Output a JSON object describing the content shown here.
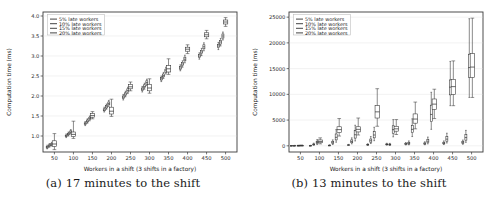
{
  "figure": {
    "panels": [
      {
        "id": "panel-a",
        "caption": "(a) 17 minutes to the shift",
        "chart_data": {
          "type": "box",
          "title": "",
          "xlabel": "Workers in a shift (3 shifts in a factory)",
          "ylabel": "Computation time (ms)",
          "xlim": [
            20,
            530
          ],
          "ylim": [
            0.6,
            4.1
          ],
          "xticks": [
            50,
            100,
            150,
            200,
            250,
            300,
            350,
            400,
            450,
            500
          ],
          "yticks": [
            1.0,
            1.5,
            2.0,
            2.5,
            3.0,
            3.5,
            4.0
          ],
          "grid": true,
          "legend_position": "upper left",
          "legend": [
            "5% late workers",
            "10% late workers",
            "15% late workers",
            "20% late workers"
          ],
          "x": [
            35,
            85,
            135,
            185,
            235,
            285,
            335,
            385,
            435,
            485
          ],
          "series": [
            {
              "name": "5% late workers",
              "offset": -4,
              "boxes": [
                {
                  "q1": 0.7,
                  "med": 0.72,
                  "q3": 0.74,
                  "lo": 0.68,
                  "hi": 0.77
                },
                {
                  "q1": 0.99,
                  "med": 1.0,
                  "q3": 1.02,
                  "lo": 0.96,
                  "hi": 1.05
                },
                {
                  "q1": 1.29,
                  "med": 1.31,
                  "q3": 1.33,
                  "lo": 1.26,
                  "hi": 1.36
                },
                {
                  "q1": 1.63,
                  "med": 1.65,
                  "q3": 1.68,
                  "lo": 1.6,
                  "hi": 1.72
                },
                {
                  "q1": 1.94,
                  "med": 1.97,
                  "q3": 2.0,
                  "lo": 1.9,
                  "hi": 2.04
                },
                {
                  "q1": 2.14,
                  "med": 2.17,
                  "q3": 2.2,
                  "lo": 2.1,
                  "hi": 2.24
                },
                {
                  "q1": 2.4,
                  "med": 2.43,
                  "q3": 2.46,
                  "lo": 2.36,
                  "hi": 2.5
                },
                {
                  "q1": 2.67,
                  "med": 2.7,
                  "q3": 2.74,
                  "lo": 2.63,
                  "hi": 2.78
                },
                {
                  "q1": 2.97,
                  "med": 3.0,
                  "q3": 3.04,
                  "lo": 2.92,
                  "hi": 3.08
                },
                {
                  "q1": 3.21,
                  "med": 3.25,
                  "q3": 3.29,
                  "lo": 3.16,
                  "hi": 3.34
                }
              ]
            },
            {
              "name": "10% late workers",
              "offset": 2,
              "boxes": [
                {
                  "q1": 0.74,
                  "med": 0.76,
                  "q3": 0.78,
                  "lo": 0.72,
                  "hi": 0.81
                },
                {
                  "q1": 1.03,
                  "med": 1.05,
                  "q3": 1.07,
                  "lo": 1.0,
                  "hi": 1.1
                },
                {
                  "q1": 1.35,
                  "med": 1.37,
                  "q3": 1.4,
                  "lo": 1.32,
                  "hi": 1.43
                },
                {
                  "q1": 1.7,
                  "med": 1.73,
                  "q3": 1.76,
                  "lo": 1.67,
                  "hi": 1.8
                },
                {
                  "q1": 2.02,
                  "med": 2.05,
                  "q3": 2.08,
                  "lo": 1.98,
                  "hi": 2.12
                },
                {
                  "q1": 2.21,
                  "med": 2.24,
                  "q3": 2.28,
                  "lo": 2.17,
                  "hi": 2.32
                },
                {
                  "q1": 2.48,
                  "med": 2.51,
                  "q3": 2.55,
                  "lo": 2.44,
                  "hi": 2.59
                },
                {
                  "q1": 2.76,
                  "med": 2.8,
                  "q3": 2.84,
                  "lo": 2.72,
                  "hi": 2.88
                },
                {
                  "q1": 3.06,
                  "med": 3.1,
                  "q3": 3.14,
                  "lo": 3.01,
                  "hi": 3.19
                },
                {
                  "q1": 3.3,
                  "med": 3.35,
                  "q3": 3.39,
                  "lo": 3.25,
                  "hi": 3.44
                }
              ]
            },
            {
              "name": "15% late workers",
              "offset": 8,
              "boxes": [
                {
                  "q1": 0.77,
                  "med": 0.79,
                  "q3": 0.81,
                  "lo": 0.75,
                  "hi": 0.84
                },
                {
                  "q1": 1.08,
                  "med": 1.1,
                  "q3": 1.13,
                  "lo": 1.05,
                  "hi": 1.16
                },
                {
                  "q1": 1.41,
                  "med": 1.44,
                  "q3": 1.47,
                  "lo": 1.38,
                  "hi": 1.5
                },
                {
                  "q1": 1.78,
                  "med": 1.81,
                  "q3": 1.85,
                  "lo": 1.74,
                  "hi": 1.89
                },
                {
                  "q1": 2.1,
                  "med": 2.14,
                  "q3": 2.18,
                  "lo": 2.06,
                  "hi": 2.22
                },
                {
                  "q1": 2.3,
                  "med": 2.34,
                  "q3": 2.38,
                  "lo": 2.26,
                  "hi": 2.42
                },
                {
                  "q1": 2.59,
                  "med": 2.63,
                  "q3": 2.67,
                  "lo": 2.55,
                  "hi": 2.72
                },
                {
                  "q1": 2.88,
                  "med": 2.92,
                  "q3": 2.97,
                  "lo": 2.83,
                  "hi": 3.02
                },
                {
                  "q1": 3.18,
                  "med": 3.23,
                  "q3": 3.28,
                  "lo": 3.13,
                  "hi": 3.33
                },
                {
                  "q1": 3.45,
                  "med": 3.5,
                  "q3": 3.55,
                  "lo": 3.4,
                  "hi": 3.6
                }
              ]
            },
            {
              "name": "20% late workers",
              "offset": 15,
              "wide": true,
              "boxes": [
                {
                  "q1": 0.74,
                  "med": 0.8,
                  "q3": 0.88,
                  "lo": 0.66,
                  "hi": 1.06
                },
                {
                  "q1": 0.99,
                  "med": 1.04,
                  "q3": 1.1,
                  "lo": 0.94,
                  "hi": 1.37
                },
                {
                  "q1": 1.47,
                  "med": 1.51,
                  "q3": 1.56,
                  "lo": 1.43,
                  "hi": 1.61
                },
                {
                  "q1": 1.55,
                  "med": 1.62,
                  "q3": 1.72,
                  "lo": 1.49,
                  "hi": 1.92
                },
                {
                  "q1": 2.18,
                  "med": 2.23,
                  "q3": 2.29,
                  "lo": 2.13,
                  "hi": 2.35
                },
                {
                  "q1": 2.13,
                  "med": 2.2,
                  "q3": 2.29,
                  "lo": 2.07,
                  "hi": 2.43
                },
                {
                  "q1": 2.6,
                  "med": 2.68,
                  "q3": 2.76,
                  "lo": 2.54,
                  "hi": 2.93
                },
                {
                  "q1": 3.12,
                  "med": 3.17,
                  "q3": 3.22,
                  "lo": 3.06,
                  "hi": 3.28
                },
                {
                  "q1": 3.48,
                  "med": 3.53,
                  "q3": 3.58,
                  "lo": 3.43,
                  "hi": 3.64
                },
                {
                  "q1": 3.8,
                  "med": 3.85,
                  "q3": 3.9,
                  "lo": 3.74,
                  "hi": 3.96
                }
              ]
            }
          ]
        }
      },
      {
        "id": "panel-b",
        "caption": "(b) 13 minutes to the shift",
        "chart_data": {
          "type": "box",
          "title": "",
          "xlabel": "Workers in a shift (3 shifts in a factory)",
          "ylabel": "Computation time (ms)",
          "xlim": [
            20,
            530
          ],
          "ylim": [
            -1200,
            26000
          ],
          "xticks": [
            50,
            100,
            150,
            200,
            250,
            300,
            350,
            400,
            450,
            500
          ],
          "yticks": [
            0,
            5000,
            10000,
            15000,
            20000,
            25000
          ],
          "grid": true,
          "legend_position": "upper left",
          "legend": [
            "5% late workers",
            "10% late workers",
            "15% late workers",
            "20% late workers"
          ],
          "x": [
            35,
            85,
            135,
            185,
            235,
            285,
            335,
            385,
            435,
            485
          ],
          "series": [
            {
              "name": "5% late workers",
              "offset": -8,
              "boxes": [
                {
                  "q1": 20,
                  "med": 30,
                  "q3": 45,
                  "lo": 10,
                  "hi": 60
                },
                {
                  "q1": 40,
                  "med": 55,
                  "q3": 75,
                  "lo": 25,
                  "hi": 100
                },
                {
                  "q1": 70,
                  "med": 95,
                  "q3": 130,
                  "lo": 45,
                  "hi": 180
                },
                {
                  "q1": 110,
                  "med": 150,
                  "q3": 200,
                  "lo": 70,
                  "hi": 280
                },
                {
                  "q1": 160,
                  "med": 220,
                  "q3": 300,
                  "lo": 100,
                  "hi": 400
                },
                {
                  "q1": 200,
                  "med": 270,
                  "q3": 370,
                  "lo": 130,
                  "hi": 500
                },
                {
                  "q1": 260,
                  "med": 350,
                  "q3": 470,
                  "lo": 170,
                  "hi": 640
                },
                {
                  "q1": 320,
                  "med": 430,
                  "q3": 580,
                  "lo": 210,
                  "hi": 780
                },
                {
                  "q1": 390,
                  "med": 520,
                  "q3": 700,
                  "lo": 250,
                  "hi": 950
                },
                {
                  "q1": 460,
                  "med": 610,
                  "q3": 830,
                  "lo": 300,
                  "hi": 1120
                }
              ]
            },
            {
              "name": "10% late workers",
              "offset": 0,
              "boxes": [
                {
                  "q1": 30,
                  "med": 45,
                  "q3": 65,
                  "lo": 15,
                  "hi": 90
                },
                {
                  "q1": 180,
                  "med": 260,
                  "q3": 360,
                  "lo": 110,
                  "hi": 520
                },
                {
                  "q1": 420,
                  "med": 600,
                  "q3": 830,
                  "lo": 260,
                  "hi": 1150
                },
                {
                  "q1": 600,
                  "med": 850,
                  "q3": 1150,
                  "lo": 380,
                  "hi": 1550
                },
                {
                  "q1": 700,
                  "med": 980,
                  "q3": 1320,
                  "lo": 440,
                  "hi": 1800
                },
                {
                  "q1": 160,
                  "med": 240,
                  "q3": 340,
                  "lo": 90,
                  "hi": 480
                },
                {
                  "q1": 330,
                  "med": 480,
                  "q3": 680,
                  "lo": 200,
                  "hi": 950
                },
                {
                  "q1": 620,
                  "med": 900,
                  "q3": 1250,
                  "lo": 380,
                  "hi": 1700
                },
                {
                  "q1": 900,
                  "med": 1300,
                  "q3": 1800,
                  "lo": 550,
                  "hi": 2450
                },
                {
                  "q1": 1100,
                  "med": 1600,
                  "q3": 2200,
                  "lo": 680,
                  "hi": 3000
                }
              ]
            },
            {
              "name": "15% late workers",
              "offset": 9,
              "boxes": [
                {
                  "q1": 40,
                  "med": 60,
                  "q3": 85,
                  "lo": 20,
                  "hi": 120
                },
                {
                  "q1": 420,
                  "med": 620,
                  "q3": 870,
                  "lo": 250,
                  "hi": 1200
                },
                {
                  "q1": 1150,
                  "med": 1650,
                  "q3": 2300,
                  "lo": 700,
                  "hi": 3150
                },
                {
                  "q1": 1500,
                  "med": 2150,
                  "q3": 2950,
                  "lo": 950,
                  "hi": 4000
                },
                {
                  "q1": 1550,
                  "med": 2100,
                  "q3": 2750,
                  "lo": 1000,
                  "hi": 3600
                },
                {
                  "q1": 2450,
                  "med": 3150,
                  "q3": 3900,
                  "lo": 1750,
                  "hi": 5100
                },
                {
                  "q1": 2550,
                  "med": 3200,
                  "q3": 3950,
                  "lo": 1800,
                  "hi": 5250
                },
                {
                  "q1": 4700,
                  "med": 6100,
                  "q3": 7900,
                  "lo": 3200,
                  "hi": 10400
                },
                {
                  "q1": 9900,
                  "med": 11400,
                  "q3": 12800,
                  "lo": 7800,
                  "hi": 16400
                },
                {
                  "q1": 13300,
                  "med": 15200,
                  "q3": 17800,
                  "lo": 9400,
                  "hi": 24700
                }
              ]
            },
            {
              "name": "20% late workers",
              "offset": 17,
              "wide": true,
              "boxes": [
                {
                  "q1": 50,
                  "med": 75,
                  "q3": 105,
                  "lo": 25,
                  "hi": 150
                },
                {
                  "q1": 600,
                  "med": 850,
                  "q3": 1150,
                  "lo": 380,
                  "hi": 1550
                },
                {
                  "q1": 2600,
                  "med": 3150,
                  "q3": 3700,
                  "lo": 1900,
                  "hi": 5300
                },
                {
                  "q1": 2700,
                  "med": 3200,
                  "q3": 3700,
                  "lo": 2100,
                  "hi": 5400
                },
                {
                  "q1": 5400,
                  "med": 6600,
                  "q3": 7800,
                  "lo": 3800,
                  "hi": 11100
                },
                {
                  "q1": 2850,
                  "med": 3300,
                  "q3": 3800,
                  "lo": 2200,
                  "hi": 5100
                },
                {
                  "q1": 4400,
                  "med": 5200,
                  "q3": 6200,
                  "lo": 3300,
                  "hi": 8500
                },
                {
                  "q1": 7100,
                  "med": 8100,
                  "q3": 9100,
                  "lo": 5300,
                  "hi": 11000
                },
                {
                  "q1": 10000,
                  "med": 11500,
                  "q3": 12900,
                  "lo": 7800,
                  "hi": 16500
                },
                {
                  "q1": 13300,
                  "med": 15300,
                  "q3": 17900,
                  "lo": 9400,
                  "hi": 24800
                }
              ]
            }
          ]
        }
      }
    ]
  }
}
